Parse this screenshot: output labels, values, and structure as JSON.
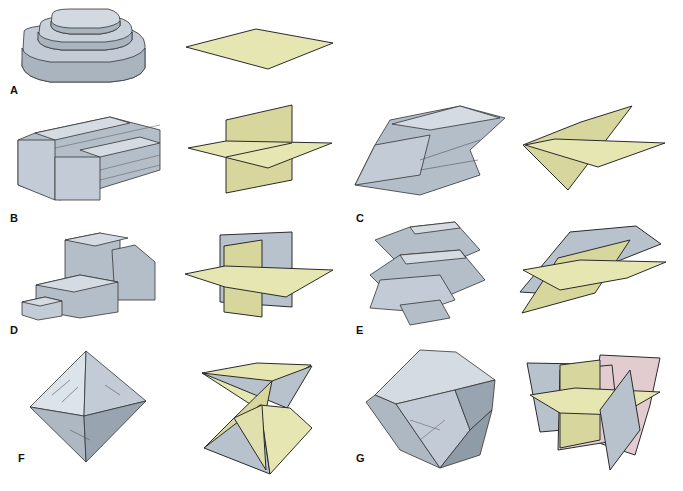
{
  "figure": {
    "colors": {
      "mineral_fill": "#c3ccd6",
      "mineral_shade": "#9aa6b2",
      "mineral_light": "#dde3ea",
      "plane_yellow": "#e6e6b3",
      "plane_blue": "#b8c2cc",
      "plane_pink": "#e2ccd0",
      "outline": "#2a2a2a"
    },
    "panels": [
      {
        "label": "A",
        "cleavage": "one direction (basal)"
      },
      {
        "label": "B",
        "cleavage": "two directions at 90°"
      },
      {
        "label": "C",
        "cleavage": "two directions not at 90°"
      },
      {
        "label": "D",
        "cleavage": "three directions at 90° (cubic)"
      },
      {
        "label": "E",
        "cleavage": "three directions not at 90° (rhombohedral)"
      },
      {
        "label": "F",
        "cleavage": "four directions (octahedral)"
      },
      {
        "label": "G",
        "cleavage": "six directions (dodecahedral)"
      }
    ]
  }
}
